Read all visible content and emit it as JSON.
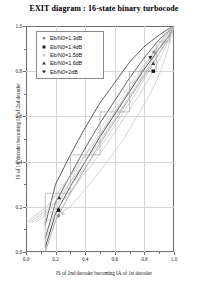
{
  "title": "EXIT diagram : 16-state binary turbocode",
  "axes": {
    "xlabel": "IS of 2nd decoder becoming IA of 1st decoder",
    "ylabel": "IS of 1st decoder becoming IA of 2nd decoder",
    "xticks": [
      "0.0",
      "0.2",
      "0.4",
      "0.6",
      "0.8",
      "1.0"
    ],
    "yticks": [
      "0.0",
      "0.2",
      "0.4",
      "0.6",
      "0.8",
      "1.0"
    ],
    "xlim": [
      0,
      1
    ],
    "ylim": [
      0,
      1
    ]
  },
  "legend": {
    "position": "upper-left",
    "items": [
      {
        "label": "Eb/N0=1.3dB",
        "marker": "circle",
        "color": "#8d8d8d"
      },
      {
        "label": "Eb/N0=1.4dB",
        "marker": "square",
        "color": "#1a1a1a"
      },
      {
        "label": "Eb/N0=1.5dB",
        "marker": "circle-open",
        "color": "#cfcfcf"
      },
      {
        "label": "Eb/N0=1.6dB",
        "marker": "tri-up",
        "color": "#3a3a3a"
      },
      {
        "label": "Eb/N0=2dB",
        "marker": "tri-dn",
        "color": "#2b2b2b"
      }
    ]
  },
  "chart_data": {
    "type": "line",
    "title": "EXIT diagram : 16-state binary turbocode",
    "xlabel": "IS of 2nd decoder becoming IA of 1st decoder",
    "ylabel": "IS of 1st decoder becoming IA of 2nd decoder",
    "xlim": [
      0,
      1
    ],
    "ylim": [
      0,
      1
    ],
    "grid": true,
    "legend_position": "upper-left",
    "series": [
      {
        "name": "Eb/N0=1.3dB",
        "marker": "circle",
        "color": "#8d8d8d",
        "x": [
          0.13,
          0.2,
          0.3,
          0.4,
          0.5,
          0.6,
          0.7,
          0.8,
          0.9,
          0.97,
          1.0
        ],
        "y": [
          0.0,
          0.14,
          0.26,
          0.37,
          0.48,
          0.58,
          0.68,
          0.78,
          0.88,
          0.95,
          1.0
        ]
      },
      {
        "name": "Eb/N0=1.4dB",
        "marker": "square",
        "color": "#1a1a1a",
        "x": [
          0.13,
          0.2,
          0.3,
          0.4,
          0.5,
          0.6,
          0.7,
          0.8,
          0.9,
          0.97,
          1.0
        ],
        "y": [
          0.02,
          0.17,
          0.29,
          0.4,
          0.51,
          0.61,
          0.71,
          0.81,
          0.9,
          0.96,
          1.0
        ]
      },
      {
        "name": "Eb/N0=1.5dB",
        "marker": "circle-open",
        "color": "#cfcfcf",
        "x": [
          0.13,
          0.2,
          0.3,
          0.4,
          0.5,
          0.6,
          0.7,
          0.8,
          0.9,
          0.97,
          1.0
        ],
        "y": [
          0.04,
          0.19,
          0.31,
          0.43,
          0.54,
          0.64,
          0.74,
          0.83,
          0.92,
          0.97,
          1.0
        ]
      },
      {
        "name": "Eb/N0=1.6dB",
        "marker": "tri-up",
        "color": "#3a3a3a",
        "x": [
          0.13,
          0.2,
          0.3,
          0.4,
          0.5,
          0.6,
          0.7,
          0.8,
          0.9,
          0.97,
          1.0
        ],
        "y": [
          0.06,
          0.22,
          0.34,
          0.46,
          0.57,
          0.67,
          0.77,
          0.86,
          0.94,
          0.98,
          1.0
        ]
      },
      {
        "name": "Eb/N0=2dB",
        "marker": "tri-dn",
        "color": "#2b2b2b",
        "x": [
          0.13,
          0.2,
          0.3,
          0.4,
          0.5,
          0.6,
          0.7,
          0.8,
          0.9,
          0.97,
          1.0
        ],
        "y": [
          0.12,
          0.3,
          0.43,
          0.55,
          0.66,
          0.75,
          0.84,
          0.91,
          0.96,
          0.99,
          1.0
        ]
      },
      {
        "name": "mirrored Eb/N0=1.3dB",
        "marker": "none",
        "color": "#b9b9b9",
        "x": [
          0.0,
          0.14,
          0.26,
          0.37,
          0.48,
          0.58,
          0.68,
          0.78,
          0.88,
          0.95,
          1.0
        ],
        "y": [
          0.13,
          0.2,
          0.3,
          0.4,
          0.5,
          0.6,
          0.7,
          0.8,
          0.9,
          0.97,
          1.0
        ]
      },
      {
        "name": "mirrored Eb/N0=1.4dB",
        "marker": "none",
        "color": "#b9b9b9",
        "x": [
          0.02,
          0.17,
          0.29,
          0.4,
          0.51,
          0.61,
          0.71,
          0.81,
          0.9,
          0.96,
          1.0
        ],
        "y": [
          0.13,
          0.2,
          0.3,
          0.4,
          0.5,
          0.6,
          0.7,
          0.8,
          0.9,
          0.97,
          1.0
        ]
      },
      {
        "name": "mirrored Eb/N0=1.5dB",
        "marker": "none",
        "color": "#c6c6c6",
        "x": [
          0.04,
          0.19,
          0.31,
          0.43,
          0.54,
          0.64,
          0.74,
          0.83,
          0.92,
          0.97,
          1.0
        ],
        "y": [
          0.13,
          0.2,
          0.3,
          0.4,
          0.5,
          0.6,
          0.7,
          0.8,
          0.9,
          0.97,
          1.0
        ]
      },
      {
        "name": "mirrored Eb/N0=1.6dB",
        "marker": "none",
        "color": "#c6c6c6",
        "x": [
          0.06,
          0.22,
          0.34,
          0.46,
          0.57,
          0.67,
          0.77,
          0.86,
          0.94,
          0.98,
          1.0
        ],
        "y": [
          0.13,
          0.2,
          0.3,
          0.4,
          0.5,
          0.6,
          0.7,
          0.8,
          0.9,
          0.97,
          1.0
        ]
      },
      {
        "name": "mirrored Eb/N0=2dB",
        "marker": "none",
        "color": "#c6c6c6",
        "x": [
          0.12,
          0.3,
          0.43,
          0.55,
          0.66,
          0.75,
          0.84,
          0.91,
          0.96,
          0.99,
          1.0
        ],
        "y": [
          0.13,
          0.2,
          0.3,
          0.4,
          0.5,
          0.6,
          0.7,
          0.8,
          0.9,
          0.97,
          1.0
        ]
      },
      {
        "name": "decoding trajectory",
        "marker": "none",
        "color": "#a8a8a8",
        "staircase": true,
        "x": [
          0.13,
          0.13,
          0.3,
          0.3,
          0.5,
          0.5,
          0.7,
          0.7,
          0.88,
          0.88,
          0.97,
          0.97,
          1.0
        ],
        "y": [
          0.0,
          0.26,
          0.26,
          0.43,
          0.43,
          0.62,
          0.62,
          0.8,
          0.8,
          0.93,
          0.93,
          0.99,
          1.0
        ]
      }
    ],
    "marker_points": [
      {
        "series": "Eb/N0=1.3dB",
        "x": 0.22,
        "y": 0.16
      },
      {
        "series": "Eb/N0=1.4dB",
        "x": 0.22,
        "y": 0.185
      },
      {
        "series": "Eb/N0=1.5dB",
        "x": 0.25,
        "y": 0.17
      },
      {
        "series": "Eb/N0=1.6dB",
        "x": 0.225,
        "y": 0.24
      },
      {
        "series": "Eb/N0=2dB",
        "x": 0.84,
        "y": 0.86
      },
      {
        "series": "Eb/N0=1.4dB",
        "x": 0.86,
        "y": 0.8
      },
      {
        "series": "Eb/N0=1.6dB",
        "x": 0.86,
        "y": 0.835
      },
      {
        "series": "Eb/N0=1.3dB",
        "x": 0.865,
        "y": 0.885
      }
    ]
  }
}
